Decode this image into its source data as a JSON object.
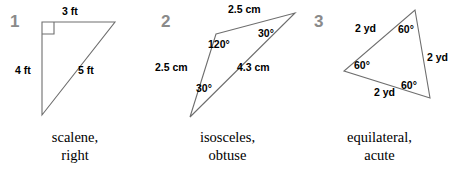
{
  "page": {
    "width": 454,
    "height": 172,
    "background": "#ffffff",
    "stroke_color": "#6e6e6e",
    "index_color": "#8a8a8a",
    "label_color": "#000000"
  },
  "figures": [
    {
      "index": "1",
      "shape": "right-triangle",
      "vertices": {
        "top_left": [
          42,
          22
        ],
        "top_right": [
          115,
          22
        ],
        "bottom_left": [
          42,
          115
        ]
      },
      "right_angle_at": "top_left",
      "side_labels": [
        {
          "name": "top-side-label",
          "text": "3 ft",
          "x": 62,
          "y": 6
        },
        {
          "name": "left-side-label",
          "text": "4 ft",
          "x": 15,
          "y": 65
        },
        {
          "name": "hypotenuse-label",
          "text": "5 ft",
          "x": 78,
          "y": 65
        }
      ],
      "angle_labels": [],
      "caption_line1": "scalene,",
      "caption_line2": "right"
    },
    {
      "index": "2",
      "shape": "obtuse-isosceles-triangle",
      "vertices": {
        "obtuse": [
          216,
          34
        ],
        "right": [
          295,
          13
        ],
        "bottom_left": [
          190,
          117
        ]
      },
      "right_angle_at": null,
      "side_labels": [
        {
          "name": "top-side-label",
          "text": "2.5 cm",
          "x": 228,
          "y": 4
        },
        {
          "name": "left-side-label",
          "text": "2.5 cm",
          "x": 155,
          "y": 62
        },
        {
          "name": "base-side-label",
          "text": "4.3 cm",
          "x": 237,
          "y": 62
        }
      ],
      "angle_labels": [
        {
          "name": "angle-label-obtuse",
          "text": "120°",
          "x": 208,
          "y": 39
        },
        {
          "name": "angle-label-right-vertex",
          "text": "30°",
          "x": 258,
          "y": 28
        },
        {
          "name": "angle-label-bottom-vertex",
          "text": "30°",
          "x": 196,
          "y": 83
        }
      ],
      "caption_line1": "isosceles,",
      "caption_line2": "obtuse"
    },
    {
      "index": "3",
      "shape": "equilateral-triangle",
      "vertices": {
        "top": [
          415,
          10
        ],
        "left": [
          344,
          71
        ],
        "bottom_right": [
          430,
          98
        ]
      },
      "right_angle_at": null,
      "side_labels": [
        {
          "name": "upper-left-side-label",
          "text": "2 yd",
          "x": 355,
          "y": 23
        },
        {
          "name": "right-side-label",
          "text": "2 yd",
          "x": 427,
          "y": 52
        },
        {
          "name": "bottom-side-label",
          "text": "2 yd",
          "x": 374,
          "y": 87
        }
      ],
      "angle_labels": [
        {
          "name": "angle-label-top",
          "text": "60°",
          "x": 398,
          "y": 24
        },
        {
          "name": "angle-label-left",
          "text": "60°",
          "x": 354,
          "y": 60
        },
        {
          "name": "angle-label-bottom-right",
          "text": "60°",
          "x": 401,
          "y": 80
        }
      ],
      "caption_line1": "equilateral,",
      "caption_line2": "acute"
    }
  ],
  "index_positions": [
    {
      "x": 10,
      "y": 13
    },
    {
      "x": 161,
      "y": 13
    },
    {
      "x": 314,
      "y": 13
    }
  ]
}
